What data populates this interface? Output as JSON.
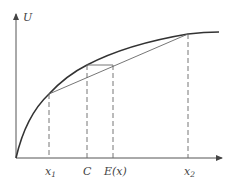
{
  "diagram": {
    "axes": {
      "y_label": "U",
      "x_label": ""
    },
    "ticks": [
      {
        "id": "x1",
        "label": "x",
        "subscript": "1"
      },
      {
        "id": "C",
        "label": "C",
        "subscript": ""
      },
      {
        "id": "Ex",
        "label": "E(x)",
        "subscript": ""
      },
      {
        "id": "x2",
        "label": "x",
        "subscript": "2"
      }
    ],
    "colors": {
      "curve": "#333333",
      "chord": "#555555",
      "axis": "#555555",
      "dashed": "#666666"
    }
  }
}
